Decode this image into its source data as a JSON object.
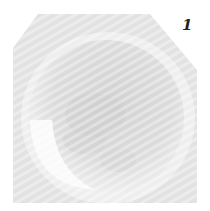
{
  "figure": {
    "panel_label": "1",
    "colors": {
      "background": "#ffffff",
      "field": "#e4e4e4",
      "rim": "#efefef",
      "interior": "#d6d6d6",
      "highlight": "#fafafa",
      "label": "#222222"
    }
  }
}
